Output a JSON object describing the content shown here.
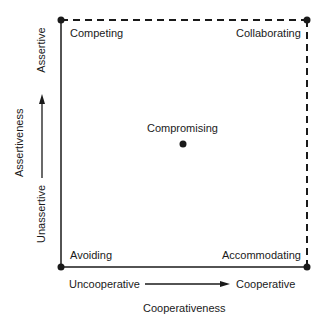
{
  "diagram": {
    "modes": {
      "competing": "Competing",
      "collaborating": "Collaborating",
      "compromising": "Compromising",
      "avoiding": "Avoiding",
      "accommodating": "Accommodating"
    },
    "x_axis": {
      "label": "Cooperativeness",
      "low": "Uncooperative",
      "high": "Cooperative"
    },
    "y_axis": {
      "label": "Assertiveness",
      "low": "Unassertive",
      "high": "Assertive"
    },
    "colors": {
      "line": "#1a1a1a",
      "background": "#ffffff"
    }
  }
}
